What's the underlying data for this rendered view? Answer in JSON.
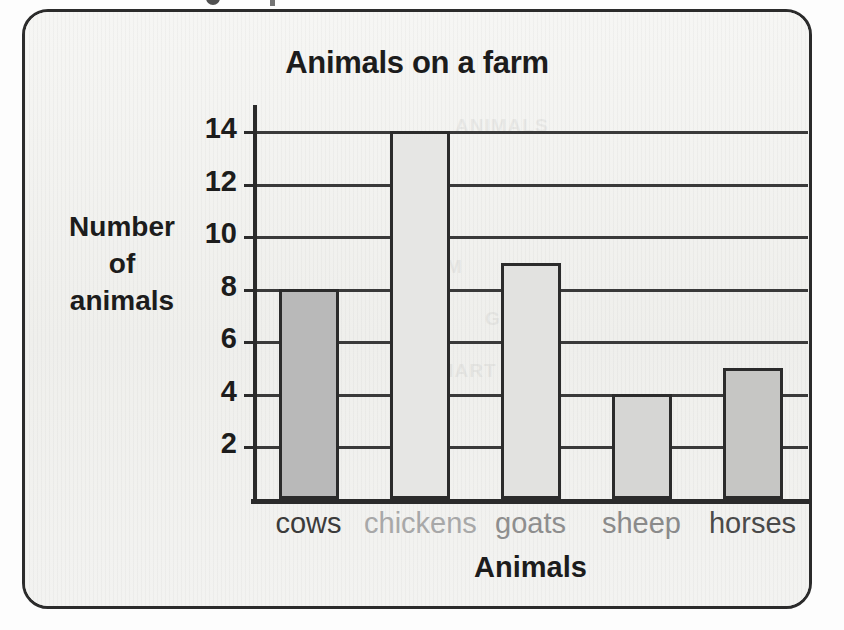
{
  "chart_data": {
    "type": "bar",
    "title": "Animals on a farm",
    "xlabel": "Animals",
    "ylabel": "Number of animals",
    "ylabel_lines": [
      "Number",
      "of",
      "animals"
    ],
    "categories": [
      "cows",
      "chickens",
      "goats",
      "sheep",
      "horses"
    ],
    "values": [
      8,
      14,
      9,
      4,
      5
    ],
    "ylim": [
      0,
      15
    ],
    "yticks": [
      2,
      4,
      6,
      8,
      10,
      12,
      14
    ],
    "ytick_labels": [
      "2",
      "4",
      "6",
      "8",
      "10",
      "12",
      "14"
    ],
    "grid": true,
    "legend": "none",
    "bar_colors": [
      "#b9b9b9",
      "#e6e6e4",
      "#e2e2e0",
      "#d6d6d4",
      "#c6c6c4"
    ],
    "bar_outline_color": "#2b2b2b",
    "label_colors": [
      "#3b3b3b",
      "#a8a8a8",
      "#8e8e8e",
      "#8a8a8a",
      "#4a4a4a"
    ]
  },
  "page": {
    "background_color": "#f2f2f0",
    "border_color": "#2b2b2b",
    "ghost_text": [
      "ANIMALS",
      "FARM",
      "GRAPH",
      "CHART"
    ]
  }
}
